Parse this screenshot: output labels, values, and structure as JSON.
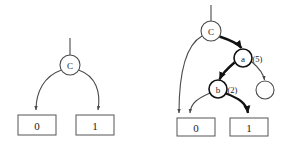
{
  "figure": {
    "background_color": "#ffffff",
    "thin_stroke_color": "#4a4a4a",
    "bold_stroke_color": "#111111",
    "node_fill": "#ffffff",
    "box_fill": "#ffffff",
    "box_stroke_color": "#555555"
  },
  "left_diagram": {
    "name": "before-state",
    "root": {
      "label": "C",
      "cx": 70,
      "cy": 65,
      "r": 10
    },
    "root_stub": {
      "x": 70,
      "y_top": 38,
      "y_bottom": 55
    },
    "cells": [
      {
        "label": "0",
        "x": 18,
        "y": 115,
        "w": 38,
        "h": 20
      },
      {
        "label": "1",
        "x": 76,
        "y": 115,
        "w": 38,
        "h": 20
      }
    ],
    "edges": [
      {
        "name": "c-to-zero",
        "style": "thin",
        "arrow": true
      },
      {
        "name": "c-to-one",
        "style": "thin",
        "arrow": true
      }
    ]
  },
  "right_diagram": {
    "name": "after-state",
    "nodes": [
      {
        "id": "c",
        "label": "C",
        "cx": 211,
        "cy": 31,
        "r": 10
      },
      {
        "id": "a",
        "label": "a",
        "cx": 243,
        "cy": 58,
        "r": 9,
        "count": "(5)"
      },
      {
        "id": "b",
        "label": "b",
        "cx": 218,
        "cy": 89,
        "r": 9,
        "count": "(2)"
      },
      {
        "id": "empty",
        "label": "",
        "cx": 265,
        "cy": 90,
        "r": 9
      }
    ],
    "root_stub": {
      "x": 211,
      "y_top": 5,
      "y_bottom": 21
    },
    "cells": [
      {
        "label": "0",
        "x": 177,
        "y": 118,
        "w": 38,
        "h": 18
      },
      {
        "label": "1",
        "x": 230,
        "y": 118,
        "w": 38,
        "h": 18
      }
    ],
    "edges": [
      {
        "name": "c-to-zero",
        "style": "thin",
        "arrow": true
      },
      {
        "name": "c-to-a",
        "style": "bold",
        "arrow": true
      },
      {
        "name": "a-to-empty",
        "style": "thin",
        "arrow": true
      },
      {
        "name": "a-to-b",
        "style": "bold",
        "arrow": true
      },
      {
        "name": "b-to-zero",
        "style": "thin",
        "arrow": true
      },
      {
        "name": "b-to-one",
        "style": "bold",
        "arrow": true
      }
    ]
  }
}
